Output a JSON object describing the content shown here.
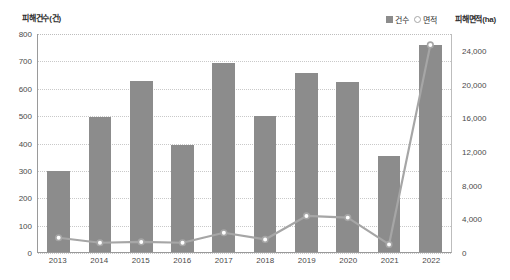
{
  "chart_data": {
    "type": "bar",
    "title": "",
    "subtitle": "",
    "xlabel": "",
    "ylabel": "피해건수(건)",
    "y2label": "피해면적(ha)",
    "categories": [
      "2013",
      "2014",
      "2015",
      "2016",
      "2017",
      "2018",
      "2019",
      "2020",
      "2021",
      "2022"
    ],
    "series": [
      {
        "name": "건수",
        "type": "bar",
        "axis": "left",
        "color": "#8c8c8c",
        "values": [
          296,
          492,
          623,
          391,
          692,
          496,
          653,
          620,
          350,
          756
        ]
      },
      {
        "name": "면적",
        "type": "line",
        "axis": "right",
        "color": "#a6a6a6",
        "marker": "open-circle",
        "values": [
          1700,
          1100,
          1200,
          1100,
          2300,
          1500,
          4300,
          4100,
          900,
          24700
        ]
      }
    ],
    "ylim": [
      0,
      800
    ],
    "y2lim": [
      0,
      26000
    ],
    "yticks": [
      "0",
      "100",
      "200",
      "300",
      "400",
      "500",
      "600",
      "700",
      "800"
    ],
    "ytick_values": [
      0,
      100,
      200,
      300,
      400,
      500,
      600,
      700,
      800
    ],
    "y2ticks": [
      "0",
      "4,000",
      "8,000",
      "12,000",
      "16,000",
      "20,000",
      "24,000"
    ],
    "y2tick_values": [
      0,
      4000,
      8000,
      12000,
      16000,
      20000,
      24000
    ],
    "grid": true,
    "grid_style": "dotted-horizontal",
    "legend_position": "top-right",
    "legend": [
      {
        "label": "건수",
        "marker": "filled-square",
        "color": "#8c8c8c"
      },
      {
        "label": "면적",
        "marker": "open-circle",
        "color": "#a6a6a6"
      }
    ]
  },
  "colors": {
    "bar": "#8c8c8c",
    "line": "#a6a6a6",
    "marker_fill": "#ffffff",
    "grid": "#c9c9c9",
    "axis": "#9a9a9a",
    "text": "#3a3a3a",
    "background": "#ffffff"
  }
}
